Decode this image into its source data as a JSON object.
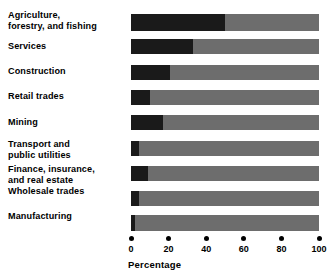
{
  "chart_data": {
    "type": "bar",
    "orientation": "horizontal",
    "title": "",
    "subtitle": "",
    "xlabel": "Percentage",
    "ylabel": "",
    "xlim": [
      0,
      100
    ],
    "xticks": [
      0,
      20,
      40,
      60,
      80,
      100
    ],
    "xticklabels": [
      "0",
      "20",
      "40",
      "60",
      "80",
      "100"
    ],
    "grid": false,
    "legend": null,
    "legend_position": "none",
    "stacked": true,
    "categories": [
      "Agriculture,\nforestry, and fishing",
      "Services",
      "Construction",
      "Retail trades",
      "Mining",
      "Transport and\npublic utilities",
      "Finance, insurance,\nand real estate",
      "Wholesale trades",
      "Manufacturing"
    ],
    "values": [
      50,
      33,
      21,
      10,
      17,
      4,
      9,
      4,
      2
    ],
    "series": [
      {
        "name": "filled",
        "color": "#1a1a1a",
        "values": [
          50,
          33,
          21,
          10,
          17,
          4,
          9,
          4,
          2
        ]
      },
      {
        "name": "remainder",
        "color": "#6d6d6d",
        "values": [
          50,
          67,
          79,
          90,
          83,
          96,
          91,
          96,
          98
        ]
      }
    ],
    "colors": {
      "bar_fill": "#1a1a1a",
      "bar_track": "#6d6d6d",
      "text": "#000000",
      "background": "#ffffff"
    }
  },
  "axis": {
    "title": "Percentage"
  }
}
